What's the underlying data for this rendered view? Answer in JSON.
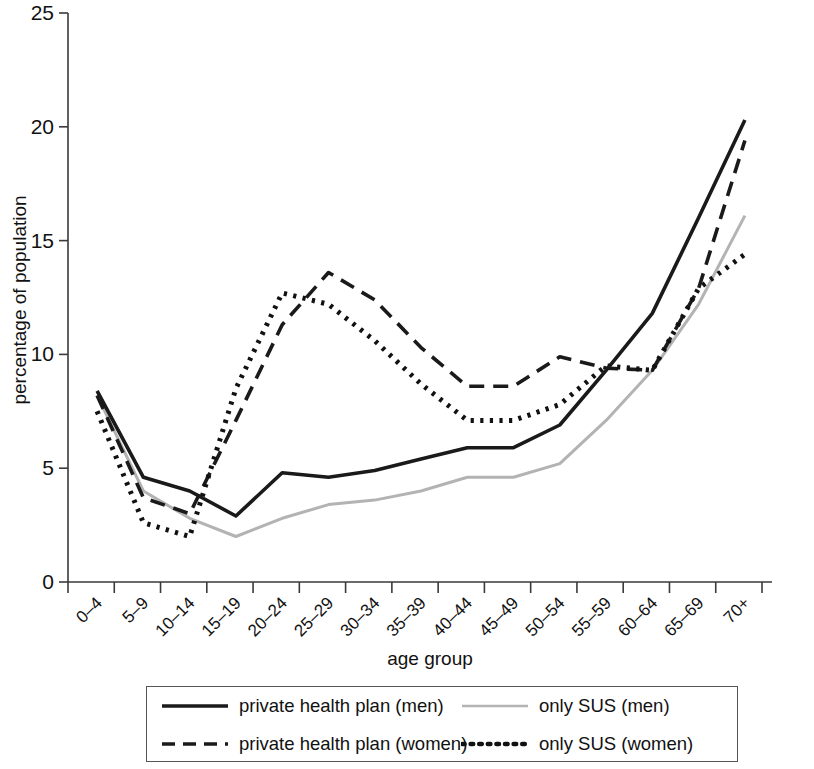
{
  "chart_data": {
    "type": "line",
    "title": "",
    "xlabel": "age group",
    "ylabel": "percentage of population",
    "ylim": [
      0,
      25
    ],
    "yticks": [
      0,
      5,
      10,
      15,
      20,
      25
    ],
    "grid": false,
    "legend_position": "bottom",
    "categories": [
      "0–4",
      "5–9",
      "10–14",
      "15–19",
      "20–24",
      "25–29",
      "30–34",
      "35–39",
      "40–44",
      "45–49",
      "50–54",
      "55–59",
      "60–64",
      "65–69",
      "70+"
    ],
    "series": [
      {
        "name": "private health plan (men)",
        "style": "solid",
        "color": "#1a1a1a",
        "values": [
          8.4,
          4.6,
          4.0,
          2.9,
          4.8,
          4.6,
          4.9,
          5.4,
          5.9,
          5.9,
          6.9,
          9.3,
          11.8,
          16.0,
          20.3
        ]
      },
      {
        "name": "private health plan (women)",
        "style": "dashed",
        "color": "#1a1a1a",
        "values": [
          8.2,
          3.7,
          3.0,
          7.1,
          11.3,
          13.6,
          12.4,
          10.3,
          8.6,
          8.6,
          9.9,
          9.4,
          9.3,
          12.9,
          19.4
        ]
      },
      {
        "name": "only SUS (men)",
        "style": "solid-light",
        "color": "#b3b3b3",
        "values": [
          8.2,
          4.0,
          2.8,
          2.0,
          2.8,
          3.4,
          3.6,
          4.0,
          4.6,
          4.6,
          5.2,
          7.1,
          9.3,
          12.2,
          16.1
        ]
      },
      {
        "name": "only SUS (women)",
        "style": "dotted",
        "color": "#111111",
        "values": [
          7.5,
          2.6,
          2.0,
          8.5,
          12.7,
          12.2,
          10.6,
          8.7,
          7.1,
          7.1,
          7.8,
          9.5,
          9.3,
          12.9,
          14.4
        ]
      }
    ]
  },
  "axis": {
    "y_title": "percentage of population",
    "x_title": "age group",
    "y_tick_labels": [
      "0",
      "5",
      "10",
      "15",
      "20",
      "25"
    ],
    "x_tick_labels": [
      "0–4",
      "5–9",
      "10–14",
      "15–19",
      "20–24",
      "25–29",
      "30–34",
      "35–39",
      "40–44",
      "45–49",
      "50–54",
      "55–59",
      "60–64",
      "65–69",
      "70+"
    ]
  },
  "legend": {
    "items": [
      {
        "label": "private health plan (men)",
        "style": "solid",
        "color": "#1a1a1a"
      },
      {
        "label": "only SUS (men)",
        "style": "solid-light",
        "color": "#b3b3b3"
      },
      {
        "label": "private health plan (women)",
        "style": "dashed",
        "color": "#1a1a1a"
      },
      {
        "label": "only SUS (women)",
        "style": "dotted",
        "color": "#111111"
      }
    ]
  }
}
